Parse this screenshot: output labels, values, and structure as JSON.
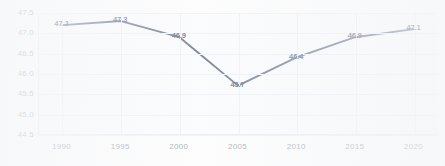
{
  "chart_data": {
    "type": "line",
    "title": "",
    "subtitle": "",
    "xlabel": "",
    "ylabel": "",
    "categories": [
      "1990",
      "1995",
      "2000",
      "2005",
      "2010",
      "2015",
      "2020"
    ],
    "x": [
      1990,
      1995,
      2000,
      2005,
      2010,
      2015,
      2020
    ],
    "values": [
      47.2,
      47.3,
      46.9,
      45.7,
      46.4,
      46.9,
      47.1
    ],
    "series": [
      {
        "name": "",
        "values": [
          47.2,
          47.3,
          46.9,
          45.7,
          46.4,
          46.9,
          47.1
        ]
      }
    ],
    "point_labels": [
      "47.2",
      "47.3",
      "46.9",
      "45.7",
      "46.4",
      "46.9",
      "47.1"
    ],
    "ylim": [
      44.5,
      47.5
    ],
    "xlim": [
      1988,
      2022
    ],
    "yticks": [
      47.5,
      47.0,
      46.5,
      46.0,
      45.5,
      45.0,
      44.5
    ],
    "ytick_labels": [
      "47.5",
      "47.0",
      "46.5",
      "46.0",
      "45.5",
      "45.0",
      "44.5"
    ],
    "xticks": [
      1990,
      1995,
      2000,
      2005,
      2010,
      2015,
      2020
    ],
    "xtick_labels": [
      "1990",
      "1995",
      "2000",
      "2005",
      "2010",
      "2015",
      "2020"
    ],
    "grid": true,
    "legend": false,
    "legend_position": "none",
    "annotations": [],
    "colors": {
      "line": "#2c3a63",
      "grid": "#e8edf3",
      "axis": "#e3e7ec",
      "tick_text": "#737f8c",
      "label_text": "#1d2b4d",
      "plot_background": "#fafbfc",
      "page_background": "#fdfdfd"
    }
  }
}
